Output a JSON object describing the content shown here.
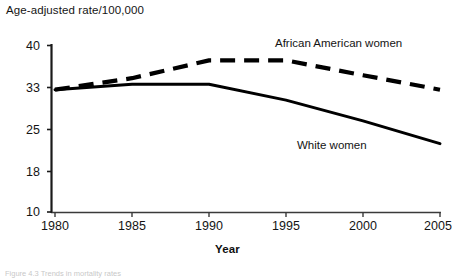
{
  "figure": {
    "title": "Age-adjusted rate/100,000",
    "caption": "Figure 4.3  Trends in mortality rates"
  },
  "axes": {
    "x_title": "Year",
    "x_ticks": [
      "1980",
      "1985",
      "1990",
      "1995",
      "2000",
      "2005"
    ],
    "y_ticks": [
      "40",
      "33",
      "25",
      "18",
      "10"
    ]
  },
  "series_labels": {
    "african_american_women": "African American women",
    "white_women": "White women"
  },
  "colors": {
    "line": "#000000",
    "axis": "#1a1a1a",
    "text": "#141414",
    "background": "#ffffff"
  },
  "chart_data": {
    "type": "line",
    "title": "Age-adjusted rate/100,000",
    "xlabel": "Year",
    "ylabel": "Age-adjusted rate/100,000",
    "x": [
      1980,
      1985,
      1990,
      1995,
      2000,
      2005
    ],
    "xlim": [
      1980,
      2005
    ],
    "y_tick_values": [
      10,
      18,
      25,
      33,
      40
    ],
    "y_axis_note": "tick labels 10, 18, 25, 33, 40 are drawn at evenly spaced positions",
    "ylim": [
      10,
      40
    ],
    "grid": false,
    "legend": "inline labels next to each curve",
    "series": [
      {
        "name": "African American women",
        "style": "dashed",
        "values": [
          32.5,
          34.5,
          37.5,
          37.5,
          35.0,
          32.5
        ]
      },
      {
        "name": "White women",
        "style": "solid",
        "values": [
          32.5,
          33.5,
          33.5,
          30.5,
          26.5,
          22.5
        ]
      }
    ]
  }
}
